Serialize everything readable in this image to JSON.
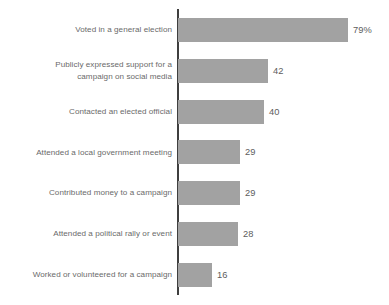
{
  "chart_data": {
    "type": "bar",
    "orientation": "horizontal",
    "title": "",
    "subtitle": "",
    "xlabel": "",
    "ylabel": "",
    "grid": false,
    "legend": null,
    "xlim": [
      0,
      79
    ],
    "categories": [
      "Voted in a general election",
      "Publicly expressed support for a\ncampaign on social media",
      "Contacted an elected official",
      "Attended a local government meeting",
      "Contributed money to a campaign",
      "Attended a political rally or event",
      "Worked or volunteered for a campaign"
    ],
    "values": [
      79,
      42,
      40,
      29,
      29,
      28,
      16
    ],
    "value_labels": [
      "79%",
      "42",
      "40",
      "29",
      "29",
      "28",
      "16"
    ],
    "bar_color": "#a2a2a2",
    "axis_color": "#3f3f3f",
    "label_color": "#6a6a6a",
    "value_color": "#5d5d5d",
    "background_color": "#ffffff"
  },
  "rows": [
    {
      "label": "Voted in a general election",
      "value_label": "79%"
    },
    {
      "label": "Publicly expressed support for a\ncampaign on social media",
      "value_label": "42"
    },
    {
      "label": "Contacted an elected official",
      "value_label": "40"
    },
    {
      "label": "Attended a local government meeting",
      "value_label": "29"
    },
    {
      "label": "Contributed money to a campaign",
      "value_label": "29"
    },
    {
      "label": "Attended a political rally or event",
      "value_label": "28"
    },
    {
      "label": "Worked or volunteered for a campaign",
      "value_label": "16"
    }
  ]
}
